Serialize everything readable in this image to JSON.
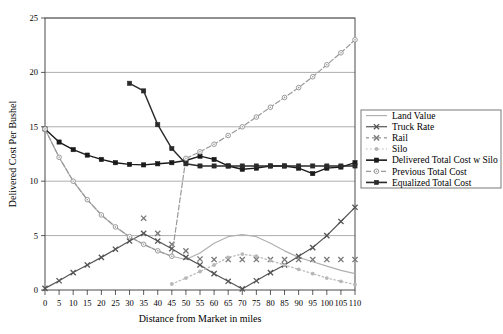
{
  "chart_data": {
    "type": "line",
    "title": "",
    "xlabel": "Distance from Market in miles",
    "ylabel": "Delivered Cost Per Bushel",
    "xlim": [
      0,
      110
    ],
    "ylim": [
      0,
      25
    ],
    "xticks": [
      0,
      5,
      10,
      15,
      20,
      25,
      30,
      35,
      40,
      45,
      50,
      55,
      60,
      65,
      70,
      75,
      80,
      85,
      90,
      95,
      100,
      105,
      110
    ],
    "yticks": [
      0,
      5,
      10,
      15,
      20,
      25
    ],
    "grid": "horizontal",
    "legend_position": "right",
    "series": [
      {
        "name": "Land Value",
        "color": "#b0b0b0",
        "marker": "none",
        "dash": "solid",
        "x": [
          0,
          5,
          10,
          15,
          20,
          25,
          30,
          35,
          40,
          45,
          50,
          55,
          60,
          65,
          70,
          75,
          80,
          85,
          90,
          95,
          100,
          105,
          110
        ],
        "y": [
          14.8,
          12.2,
          10.0,
          8.3,
          6.9,
          5.8,
          4.9,
          4.2,
          3.6,
          3.1,
          2.8,
          3.4,
          4.3,
          4.9,
          5.1,
          4.9,
          4.3,
          3.6,
          3.0,
          2.6,
          2.2,
          1.8,
          1.5
        ]
      },
      {
        "name": "Truck Rate",
        "color": "#555555",
        "marker": "x-box",
        "dash": "solid",
        "x": [
          0,
          5,
          10,
          15,
          20,
          25,
          30,
          35,
          40,
          45,
          50,
          55,
          60,
          65,
          70,
          75,
          80,
          85,
          90,
          95,
          100,
          105,
          110
        ],
        "y": [
          0.15,
          0.85,
          1.6,
          2.3,
          3.0,
          3.75,
          4.5,
          5.2,
          4.5,
          3.8,
          3.0,
          2.3,
          1.5,
          0.8,
          0.1,
          0.85,
          1.6,
          2.3,
          3.1,
          3.9,
          5.0,
          6.3,
          7.6
        ]
      },
      {
        "name": "Rail",
        "color": "#777777",
        "marker": "x-box",
        "dash": "none",
        "x": [
          35,
          40,
          45,
          50,
          55,
          60,
          65,
          70,
          75,
          80,
          85,
          90,
          95,
          100,
          105,
          110
        ],
        "y": [
          6.6,
          5.2,
          4.2,
          3.6,
          2.85,
          2.8,
          2.8,
          2.8,
          2.8,
          2.8,
          2.8,
          2.8,
          2.8,
          2.8,
          2.8,
          2.8
        ]
      },
      {
        "name": "Silo",
        "color": "#b8b8b8",
        "marker": "dot",
        "dash": "dotted",
        "x": [
          45,
          50,
          55,
          60,
          65,
          70,
          75,
          80,
          85,
          90,
          95,
          100,
          105,
          110
        ],
        "y": [
          0.55,
          1.1,
          1.7,
          2.3,
          3.0,
          3.3,
          3.1,
          2.7,
          2.3,
          1.9,
          1.5,
          1.1,
          0.8,
          0.5
        ]
      },
      {
        "name": "Delivered Total Cost w Silo",
        "color": "#1a1a1a",
        "marker": "square",
        "dash": "solid",
        "x": [
          0,
          5,
          10,
          15,
          20,
          25,
          30,
          35,
          40,
          45,
          50,
          55,
          60,
          65,
          70,
          75,
          80,
          85,
          90,
          95,
          100,
          105,
          110
        ],
        "y": [
          14.8,
          13.6,
          12.9,
          12.4,
          12.0,
          11.7,
          11.55,
          11.5,
          11.6,
          11.7,
          11.9,
          12.3,
          12.0,
          11.4,
          11.1,
          11.2,
          11.4,
          11.4,
          11.2,
          10.7,
          11.2,
          11.3,
          11.7
        ]
      },
      {
        "name": "Previous Total Cost",
        "color": "#999999",
        "marker": "circle",
        "dash": "dashed",
        "x": [
          0,
          5,
          10,
          15,
          20,
          25,
          30,
          35,
          40,
          45,
          50,
          55,
          60,
          65,
          70,
          75,
          80,
          85,
          90,
          95,
          100,
          105,
          110
        ],
        "y": [
          14.8,
          12.2,
          10.0,
          8.3,
          6.9,
          5.8,
          4.9,
          4.2,
          3.6,
          3.1,
          12.1,
          12.7,
          13.4,
          14.2,
          15.0,
          15.9,
          16.8,
          17.7,
          18.6,
          19.6,
          20.7,
          21.8,
          23.0
        ]
      },
      {
        "name": "Equalized Total Cost",
        "color": "#2a2a2a",
        "marker": "square",
        "dash": "solid",
        "x": [
          30,
          35,
          40,
          45,
          50,
          55,
          60,
          65,
          70,
          75,
          80,
          85,
          90,
          95,
          100,
          105,
          110
        ],
        "y": [
          19.0,
          18.3,
          15.2,
          13.0,
          11.6,
          11.4,
          11.4,
          11.4,
          11.4,
          11.4,
          11.4,
          11.4,
          11.4,
          11.4,
          11.4,
          11.4,
          11.4
        ]
      }
    ],
    "legend_entries": [
      {
        "label": "Land Value",
        "key": "land-value"
      },
      {
        "label": "Truck Rate",
        "key": "truck-rate"
      },
      {
        "label": "Rail",
        "key": "rail"
      },
      {
        "label": "Silo",
        "key": "silo"
      },
      {
        "label": "Delivered Total Cost w Silo",
        "key": "delivered-total-cost-w-silo"
      },
      {
        "label": "Previous Total Cost",
        "key": "previous-total-cost"
      },
      {
        "label": "Equalized Total Cost",
        "key": "equalized-total-cost"
      }
    ]
  }
}
